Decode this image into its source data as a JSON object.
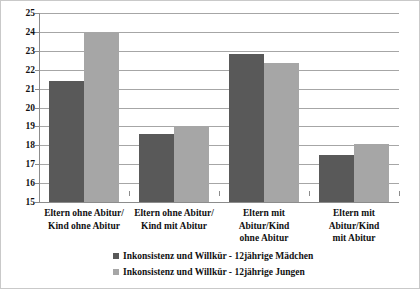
{
  "chart_data": {
    "type": "bar",
    "title": "",
    "subtitle": "",
    "xlabel": "",
    "ylabel": "",
    "ylim": [
      15,
      25
    ],
    "ytick_step": 1,
    "ytick_labels": [
      "25",
      "24",
      "23",
      "22",
      "21",
      "20",
      "19",
      "18",
      "17",
      "16",
      "15"
    ],
    "grid": true,
    "legend_position": "bottom",
    "categories": [
      "Eltern ohne Abitur/\nKind ohne Abitur",
      "Eltern ohne Abitur/\nKind mit Abitur",
      "Eltern mit Abitur/Kind\nohne Abitur",
      "Eltern mit Abitur/Kind\nmit Abitur"
    ],
    "category_lines": [
      [
        "Eltern ohne Abitur/",
        "Kind ohne Abitur"
      ],
      [
        "Eltern ohne Abitur/",
        "Kind mit Abitur"
      ],
      [
        "Eltern mit Abitur/Kind",
        "ohne Abitur"
      ],
      [
        "Eltern mit Abitur/Kind",
        "mit Abitur"
      ]
    ],
    "series": [
      {
        "name": "Inkonsistenz und Willkür - 12jährige Mädchen",
        "color": "#595959",
        "values": [
          21.4,
          18.6,
          22.85,
          17.5
        ]
      },
      {
        "name": "Inkonsistenz und Willkür - 12jährige Jungen",
        "color": "#a6a6a6",
        "values": [
          24.0,
          19.0,
          22.35,
          18.05
        ]
      }
    ]
  },
  "colors": {
    "series_dark": "#595959",
    "series_light": "#a6a6a6",
    "grid": "#a6a6a6",
    "axis": "#8c8c8c",
    "border": "#c9c9c9",
    "text": "#111111",
    "background": "#ffffff"
  }
}
